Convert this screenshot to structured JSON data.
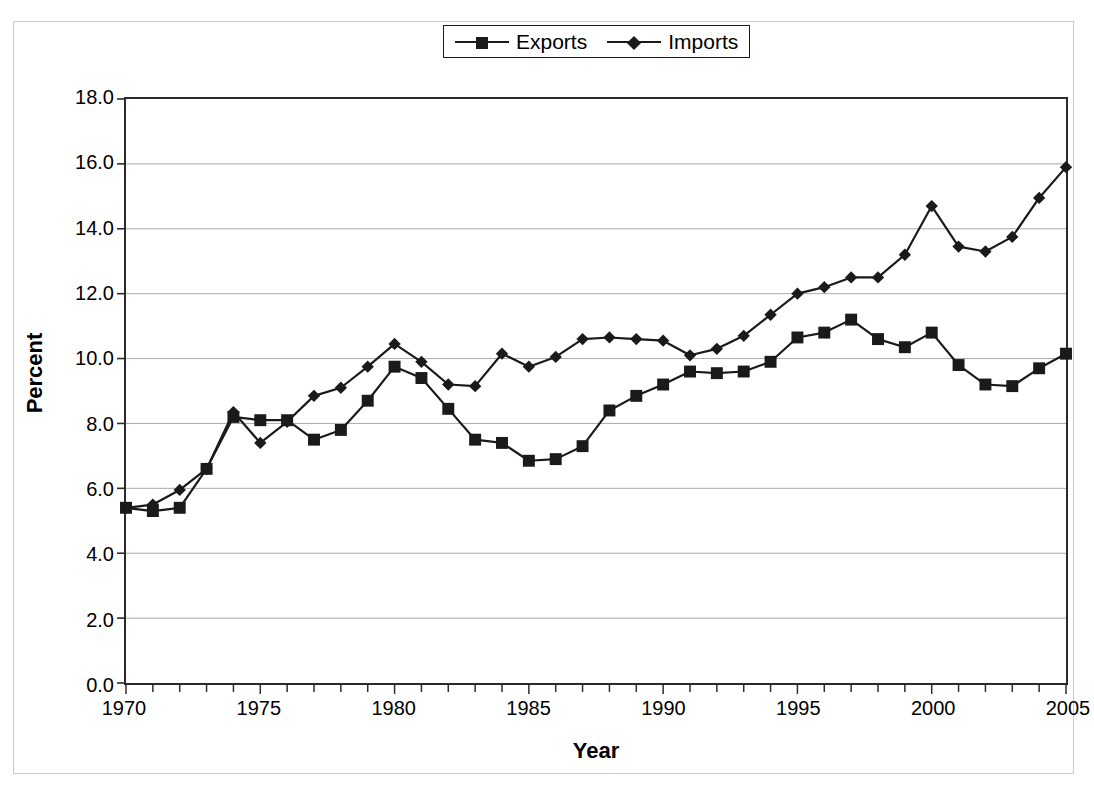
{
  "chart_data": {
    "type": "line",
    "title": "",
    "xlabel": "Year",
    "ylabel": "Percent",
    "xlim": [
      1970,
      2005
    ],
    "ylim": [
      0.0,
      18.0
    ],
    "ytick_labels": [
      "0.0",
      "2.0",
      "4.0",
      "6.0",
      "8.0",
      "10.0",
      "12.0",
      "14.0",
      "16.0",
      "18.0"
    ],
    "ytick_values": [
      0.0,
      2.0,
      4.0,
      6.0,
      8.0,
      10.0,
      12.0,
      14.0,
      16.0,
      18.0
    ],
    "xtick_labels": [
      "1970",
      "1975",
      "1980",
      "1985",
      "1990",
      "1995",
      "2000",
      "2005"
    ],
    "xtick_values": [
      1970,
      1975,
      1980,
      1985,
      1990,
      1995,
      2000,
      2005
    ],
    "xtick_minor_step": 1,
    "grid": "horizontal",
    "grid_color": "#aaaaaa",
    "legend_position": "top-center",
    "line_color": "#1a1a1a",
    "x": [
      1970,
      1971,
      1972,
      1973,
      1974,
      1975,
      1976,
      1977,
      1978,
      1979,
      1980,
      1981,
      1982,
      1983,
      1984,
      1985,
      1986,
      1987,
      1988,
      1989,
      1990,
      1991,
      1992,
      1993,
      1994,
      1995,
      1996,
      1997,
      1998,
      1999,
      2000,
      2001,
      2002,
      2003,
      2004,
      2005
    ],
    "series": [
      {
        "name": "Exports",
        "marker": "square",
        "values": [
          5.4,
          5.3,
          5.4,
          6.6,
          8.2,
          8.1,
          8.1,
          7.5,
          7.8,
          8.7,
          9.75,
          9.4,
          8.45,
          7.5,
          7.4,
          6.85,
          6.9,
          7.3,
          8.4,
          8.85,
          9.2,
          9.6,
          9.55,
          9.6,
          9.9,
          10.65,
          10.8,
          11.2,
          10.6,
          10.35,
          10.8,
          9.8,
          9.2,
          9.15,
          9.7,
          10.15
        ]
      },
      {
        "name": "Imports",
        "marker": "diamond",
        "values": [
          5.4,
          5.5,
          5.95,
          6.6,
          8.35,
          7.4,
          8.05,
          8.85,
          9.1,
          9.75,
          10.45,
          9.9,
          9.2,
          9.15,
          10.15,
          9.75,
          10.05,
          10.6,
          10.65,
          10.6,
          10.55,
          10.1,
          10.3,
          10.7,
          11.35,
          12.0,
          12.2,
          12.5,
          12.5,
          13.2,
          14.7,
          13.45,
          13.3,
          13.75,
          14.95,
          15.9
        ]
      }
    ]
  },
  "legend": {
    "entries": [
      {
        "label": "Exports",
        "marker": "square"
      },
      {
        "label": "Imports",
        "marker": "diamond"
      }
    ]
  },
  "axes": {
    "y_title": "Percent",
    "x_title": "Year"
  }
}
